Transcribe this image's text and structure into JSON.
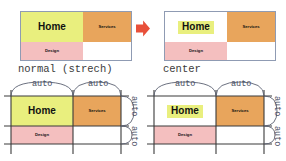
{
  "diagram": {
    "title_semantics": "css-grid-align-items-comparison",
    "colors": {
      "home_bg": "#e9ef7e",
      "services_bg": "#e8a55c",
      "design_bg": "#f4bfbf",
      "empty_bg": "#ffffff",
      "panel_border": "#8f9bb3",
      "grid_line": "#3a3a3a",
      "brace": "#5a6070",
      "arrow": "#e8503a",
      "label_text": "#4a4f63",
      "caption_text": "#3b3b3b",
      "cell_text": "#111111"
    },
    "cells": {
      "home": "Home",
      "services": "Services",
      "design": "Design"
    },
    "panels": [
      {
        "id": "top-left",
        "caption": "normal (strech)",
        "mode": "stretch",
        "cells": [
          "Home",
          "Services",
          "Design"
        ]
      },
      {
        "id": "top-right",
        "caption": "center",
        "mode": "center",
        "cells": [
          "Home",
          "Services",
          "Design"
        ]
      }
    ],
    "arrow": {
      "name": "right-arrow",
      "direction": "right"
    },
    "track_labels": {
      "column": [
        "auto",
        "auto"
      ],
      "row": [
        "auto",
        "auto"
      ]
    },
    "bottom_panels": [
      {
        "id": "bottom-left",
        "mode": "stretch",
        "columns": [
          "auto",
          "auto"
        ],
        "rows": [
          "auto",
          "auto"
        ],
        "cells": [
          "Home",
          "Services",
          "Design"
        ]
      },
      {
        "id": "bottom-right",
        "mode": "center",
        "columns": [
          "auto",
          "auto"
        ],
        "rows": [
          "auto",
          "auto"
        ],
        "cells": [
          "Home",
          "Services",
          "Design"
        ]
      }
    ]
  }
}
